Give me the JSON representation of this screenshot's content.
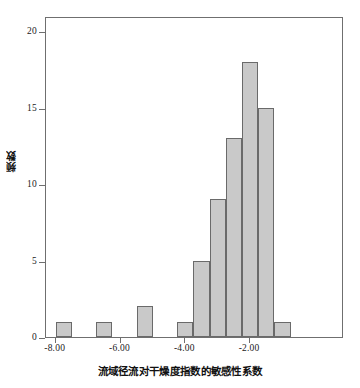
{
  "chart_data": {
    "type": "bar",
    "title": "",
    "xlabel": "流域径流对干燥度指数的敏感性系数",
    "ylabel": "频数",
    "xlim": [
      -8.3,
      0.9
    ],
    "ylim": [
      0,
      21.0
    ],
    "bin_width": 0.5,
    "grid": false,
    "legend": null,
    "xticks": [
      -8,
      -6,
      -4,
      -2
    ],
    "xtick_labels": [
      "-8.00",
      "-6.00",
      "-4.00",
      "-2.00"
    ],
    "yticks": [
      0,
      5,
      10,
      15,
      20
    ],
    "ytick_labels": [
      "0",
      "5",
      "10",
      "15",
      "20"
    ],
    "bar_fill_color": "#c9c9c9",
    "bar_edge_color": "#6a6a6a",
    "axis_color": "#6f6f6f",
    "bins": [
      {
        "left": -8.0,
        "right": -7.5,
        "center": -7.75,
        "value": 1
      },
      {
        "left": -6.75,
        "right": -6.25,
        "center": -6.5,
        "value": 1
      },
      {
        "left": -5.5,
        "right": -5.0,
        "center": -5.25,
        "value": 2
      },
      {
        "left": -4.25,
        "right": -3.75,
        "center": -4.0,
        "value": 1
      },
      {
        "left": -3.75,
        "right": -3.25,
        "center": -3.5,
        "value": 5
      },
      {
        "left": -3.25,
        "right": -2.75,
        "center": -3.0,
        "value": 9
      },
      {
        "left": -2.75,
        "right": -2.25,
        "center": -2.5,
        "value": 13
      },
      {
        "left": -2.25,
        "right": -1.75,
        "center": -2.0,
        "value": 18
      },
      {
        "left": -1.75,
        "right": -1.25,
        "center": -1.5,
        "value": 15
      },
      {
        "left": -1.25,
        "right": -0.75,
        "center": -1.0,
        "value": 1
      }
    ],
    "categories": [
      "-7.75",
      "-6.50",
      "-5.25",
      "-4.00",
      "-3.50",
      "-3.00",
      "-2.50",
      "-2.00",
      "-1.50",
      "-1.00"
    ],
    "values": [
      1,
      1,
      2,
      1,
      5,
      9,
      13,
      18,
      15,
      1
    ]
  }
}
